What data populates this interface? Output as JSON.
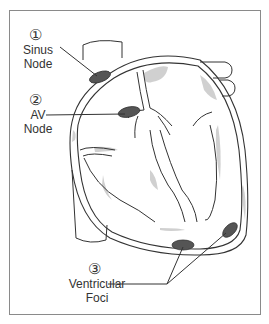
{
  "diagram": {
    "labels": [
      {
        "number": "①",
        "text_line1": "Sinus",
        "text_line2": "Node"
      },
      {
        "number": "②",
        "text_line1": "AV",
        "text_line2": "Node"
      },
      {
        "number": "③",
        "text_line1": "Ventricular",
        "text_line2": "Foci"
      }
    ],
    "colors": {
      "outline": "#333333",
      "node_fill": "#555555",
      "shading": "#c8c8c8",
      "frame": "#8a8a8a"
    }
  }
}
